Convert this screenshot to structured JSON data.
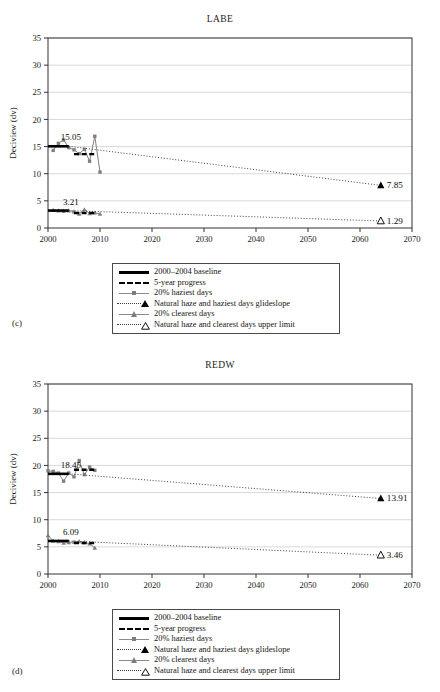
{
  "figure": {
    "panels": [
      {
        "letter": "(c)",
        "title": "LABE",
        "xlabel": "Year",
        "ylabel": "Deciview (dv)",
        "baseline_label_haziest": "15.05",
        "baseline_label_clearest": "3.21",
        "endpoint_label_haziest": "7.85",
        "endpoint_label_clearest": "1.29"
      },
      {
        "letter": "(d)",
        "title": "REDW",
        "xlabel": "Year",
        "ylabel": "Deciview (dv)",
        "baseline_label_haziest": "18.45",
        "baseline_label_clearest": "6.09",
        "endpoint_label_haziest": "13.91",
        "endpoint_label_clearest": "3.46"
      }
    ],
    "legend": {
      "items": [
        {
          "key": "solid-black-line",
          "label": "2000–2004 baseline"
        },
        {
          "key": "dashed-black-line",
          "label": "5-year progress"
        },
        {
          "key": "gray-line-square-marker",
          "label": "20% haziest days"
        },
        {
          "key": "dotted-line-filled-triangle",
          "label": "Natural haze and haziest days glideslope"
        },
        {
          "key": "gray-line-triangle-marker",
          "label": "20% clearest days"
        },
        {
          "key": "dotted-line-open-triangle",
          "label": "Natural haze and clearest days upper limit"
        }
      ]
    },
    "colors": {
      "axis": "#333333",
      "gridline": "#cfcfcf",
      "observed_series": "#808080",
      "baseline": "#000000",
      "glideslope": "#404040"
    }
  },
  "chart_data": [
    {
      "type": "line",
      "title": "LABE",
      "xlabel": "Year",
      "ylabel": "Deciview (dv)",
      "xlim": [
        2000,
        2070
      ],
      "ylim": [
        0,
        35
      ],
      "xticks": [
        2000,
        2010,
        2020,
        2030,
        2040,
        2050,
        2060,
        2070
      ],
      "yticks": [
        0,
        5,
        10,
        15,
        20,
        25,
        30,
        35
      ],
      "grid": true,
      "legend_position": "below-plot",
      "series": [
        {
          "name": "20% haziest days",
          "style": "gray-line-square-marker",
          "x": [
            2001,
            2002,
            2003,
            2004,
            2005,
            2006,
            2007,
            2008,
            2009,
            2010
          ],
          "values": [
            14.3,
            15.6,
            16.2,
            14.8,
            14.4,
            13.7,
            14.5,
            12.3,
            16.9,
            10.3
          ]
        },
        {
          "name": "20% clearest days",
          "style": "gray-line-triangle-marker",
          "x": [
            2001,
            2002,
            2003,
            2004,
            2005,
            2006,
            2007,
            2008,
            2009,
            2010
          ],
          "values": [
            3.3,
            3.2,
            3.1,
            3.2,
            3.0,
            2.6,
            3.4,
            2.7,
            2.8,
            2.6
          ]
        },
        {
          "name": "2000–2004 baseline (haziest)",
          "style": "solid-black-line",
          "x": [
            2000,
            2004
          ],
          "values": [
            15.05,
            15.05
          ],
          "label": "15.05"
        },
        {
          "name": "2000–2004 baseline (clearest)",
          "style": "solid-black-line",
          "x": [
            2000,
            2004
          ],
          "values": [
            3.21,
            3.21
          ],
          "label": "3.21"
        },
        {
          "name": "5-year progress (haziest)",
          "style": "dashed-black-line",
          "x": [
            2005,
            2009
          ],
          "values": [
            13.6,
            13.6
          ]
        },
        {
          "name": "5-year progress (clearest)",
          "style": "dashed-black-line",
          "x": [
            2005,
            2009
          ],
          "values": [
            2.75,
            2.75
          ]
        },
        {
          "name": "Natural haze and haziest days glideslope",
          "style": "dotted-line-filled-triangle",
          "x": [
            2004,
            2064
          ],
          "values": [
            15.05,
            7.85
          ],
          "endpoint_label": "7.85"
        },
        {
          "name": "Natural haze and clearest days upper limit",
          "style": "dotted-line-open-triangle",
          "x": [
            2004,
            2064
          ],
          "values": [
            3.21,
            1.29
          ],
          "endpoint_label": "1.29"
        }
      ]
    },
    {
      "type": "line",
      "title": "REDW",
      "xlabel": "Year",
      "ylabel": "Deciview (dv)",
      "xlim": [
        2000,
        2070
      ],
      "ylim": [
        0,
        35
      ],
      "xticks": [
        2000,
        2010,
        2020,
        2030,
        2040,
        2050,
        2060,
        2070
      ],
      "yticks": [
        0,
        5,
        10,
        15,
        20,
        25,
        30,
        35
      ],
      "grid": true,
      "legend_position": "below-plot",
      "series": [
        {
          "name": "20% haziest days",
          "style": "gray-line-square-marker",
          "x": [
            2000,
            2001,
            2002,
            2003,
            2004,
            2005,
            2006,
            2007,
            2008,
            2009
          ],
          "values": [
            19.0,
            18.9,
            18.6,
            17.1,
            18.6,
            17.9,
            20.9,
            18.3,
            19.7,
            19.1
          ]
        },
        {
          "name": "20% clearest days",
          "style": "gray-line-triangle-marker",
          "x": [
            2000,
            2001,
            2002,
            2003,
            2004,
            2005,
            2006,
            2007,
            2008,
            2009
          ],
          "values": [
            7.1,
            6.1,
            6.0,
            5.7,
            5.8,
            5.9,
            6.0,
            5.8,
            5.6,
            4.8
          ]
        },
        {
          "name": "2000–2004 baseline (haziest)",
          "style": "solid-black-line",
          "x": [
            2000,
            2004
          ],
          "values": [
            18.45,
            18.45
          ],
          "label": "18.45"
        },
        {
          "name": "2000–2004 baseline (clearest)",
          "style": "solid-black-line",
          "x": [
            2000,
            2004
          ],
          "values": [
            6.09,
            6.09
          ],
          "label": "6.09"
        },
        {
          "name": "5-year progress (haziest)",
          "style": "dashed-black-line",
          "x": [
            2005,
            2009
          ],
          "values": [
            19.2,
            19.2
          ]
        },
        {
          "name": "5-year progress (clearest)",
          "style": "dashed-black-line",
          "x": [
            2005,
            2009
          ],
          "values": [
            5.7,
            5.7
          ]
        },
        {
          "name": "Natural haze and haziest days glideslope",
          "style": "dotted-line-filled-triangle",
          "x": [
            2004,
            2064
          ],
          "values": [
            18.45,
            13.91
          ],
          "endpoint_label": "13.91"
        },
        {
          "name": "Natural haze and clearest days upper limit",
          "style": "dotted-line-open-triangle",
          "x": [
            2004,
            2064
          ],
          "values": [
            6.09,
            3.46
          ],
          "endpoint_label": "3.46"
        }
      ]
    }
  ]
}
